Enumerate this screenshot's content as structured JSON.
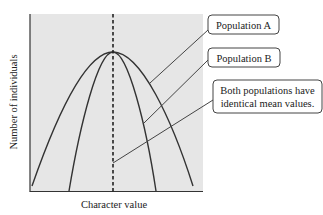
{
  "diagram": {
    "type": "distribution-comparison",
    "axes": {
      "x_label": "Character value",
      "y_label": "Number of individuals"
    },
    "callouts": [
      {
        "id": "population-a",
        "text": "Population A"
      },
      {
        "id": "population-b",
        "text": "Population B"
      },
      {
        "id": "mean-note",
        "lines": [
          "Both populations have",
          "identical mean values."
        ]
      }
    ],
    "curves": [
      {
        "name": "Population A",
        "shape": "broad bell curve"
      },
      {
        "name": "Population B",
        "shape": "narrow bell curve"
      }
    ],
    "mean_line": {
      "style": "dashed vertical",
      "meaning": "shared mean"
    },
    "colors": {
      "plot_background": "#e6e6e6",
      "line": "#333333",
      "callout_border": "#444444",
      "callout_fill": "#ffffff",
      "text": "#222222"
    }
  }
}
